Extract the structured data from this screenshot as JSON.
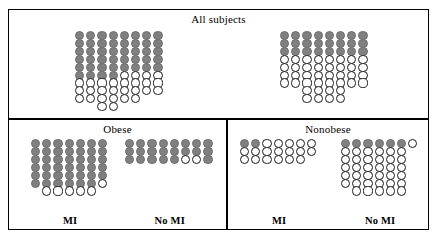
{
  "figure": {
    "kind": "isotype-dot-plot",
    "colors": {
      "filled": "#808080",
      "open_fill": "#ffffff",
      "outline": "#000000",
      "background": "#ffffff"
    }
  },
  "panels": [
    {
      "id": "all-subjects",
      "title": "All subjects",
      "groups": [
        {
          "id": "all-mi",
          "label": "MI"
        },
        {
          "id": "all-nomi",
          "label": "No MI"
        }
      ]
    },
    {
      "id": "obese",
      "title": "Obese",
      "groups": [
        {
          "id": "obese-mi",
          "label": "MI"
        },
        {
          "id": "obese-nomi",
          "label": "No MI"
        }
      ]
    },
    {
      "id": "nonobese",
      "title": "Nonobese",
      "groups": [
        {
          "id": "nonobese-mi",
          "label": "MI"
        },
        {
          "id": "nonobese-nomi",
          "label": "No MI"
        }
      ]
    }
  ],
  "chart_data": {
    "type": "bar",
    "subtitle": "Filled (gray) dots versus open (white) dots per group",
    "xlabel": "",
    "ylabel": "Count (dots)",
    "legend": [
      {
        "name": "Filled dot",
        "color": "#808080"
      },
      {
        "name": "Open dot",
        "color": "#ffffff"
      }
    ],
    "categories": [
      "All subjects – MI",
      "All subjects – No MI",
      "Obese – MI",
      "Obese – No MI",
      "Nonobese – MI",
      "Nonobese – No MI"
    ],
    "series": [
      {
        "name": "Filled",
        "values": [
          44,
          24,
          41,
          22,
          2,
          6
        ]
      },
      {
        "name": "Open",
        "values": [
          32,
          40,
          6,
          2,
          18,
          36
        ]
      }
    ],
    "groups": [
      {
        "panel": "All subjects",
        "group": "MI",
        "columns": 8,
        "filled_total": 44,
        "open_total": 32,
        "total": 76,
        "column_filled": [
          6,
          6,
          6,
          6,
          5,
          5,
          5,
          5
        ],
        "column_open": [
          3,
          3,
          4,
          4,
          4,
          4,
          3,
          3
        ]
      },
      {
        "panel": "All subjects",
        "group": "No MI",
        "columns": 8,
        "filled_total": 24,
        "open_total": 40,
        "total": 64,
        "column_filled": [
          3,
          3,
          3,
          3,
          3,
          3,
          3,
          3
        ],
        "column_open": [
          4,
          4,
          6,
          6,
          6,
          6,
          4,
          4
        ]
      },
      {
        "panel": "Obese",
        "group": "MI",
        "columns": 7,
        "filled_total": 41,
        "open_total": 6,
        "total": 47,
        "column_filled": [
          6,
          6,
          6,
          6,
          6,
          6,
          5
        ],
        "column_open": [
          0,
          1,
          1,
          1,
          1,
          1,
          1
        ]
      },
      {
        "panel": "Obese",
        "group": "No MI",
        "columns": 8,
        "filled_total": 22,
        "open_total": 2,
        "total": 24,
        "column_filled": [
          3,
          3,
          3,
          3,
          3,
          2,
          2,
          3
        ],
        "column_open": [
          0,
          0,
          0,
          0,
          0,
          1,
          1,
          0
        ]
      },
      {
        "panel": "Nonobese",
        "group": "MI",
        "columns": 7,
        "filled_total": 2,
        "open_total": 18,
        "total": 20,
        "column_filled": [
          1,
          1,
          0,
          0,
          0,
          0,
          0
        ],
        "column_open": [
          2,
          2,
          3,
          3,
          3,
          3,
          2
        ]
      },
      {
        "panel": "Nonobese",
        "group": "No MI",
        "columns": 7,
        "filled_total": 6,
        "open_total": 36,
        "total": 42,
        "column_filled": [
          1,
          1,
          1,
          1,
          1,
          1,
          0
        ],
        "column_open": [
          5,
          6,
          6,
          6,
          6,
          6,
          1
        ]
      }
    ]
  },
  "layout": {
    "dot_size": 9.2,
    "dot_step_x": 11.2,
    "dot_step_y": 7.9,
    "groups": {
      "all-mi": {
        "left": 66,
        "top": 21,
        "label_top": 94
      },
      "all-nomi": {
        "left": 271,
        "top": 21,
        "label_top": 94
      },
      "obese-mi": {
        "left": 22,
        "top": 19,
        "label_top": 76
      },
      "obese-nomi": {
        "left": 116,
        "top": 19,
        "label_top": 76
      },
      "nonobese-mi": {
        "left": 12,
        "top": 19,
        "label_top": 76
      },
      "nonobese-nomi": {
        "left": 113,
        "top": 19,
        "label_top": 76
      }
    }
  }
}
